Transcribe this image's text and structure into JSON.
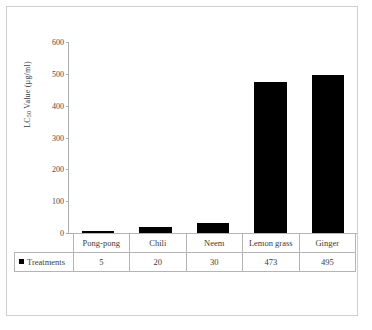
{
  "chart_data": {
    "type": "bar",
    "title": "",
    "xlabel": "",
    "ylabel": "LC50 Value (µg/ml)",
    "ylabel_main": "LC",
    "ylabel_sub": "50",
    "ylabel_rest": " Value (µg/ml)",
    "categories": [
      "Pong-pong",
      "Chili",
      "Neem",
      "Lemon grass",
      "Ginger"
    ],
    "series": [
      {
        "name": "Treatments",
        "values": [
          5,
          20,
          30,
          473,
          495
        ]
      }
    ],
    "values": [
      5,
      20,
      30,
      473,
      495
    ],
    "ylim": [
      0,
      600
    ],
    "yticks": [
      0,
      100,
      200,
      300,
      400,
      500,
      600
    ],
    "ytick_labels": [
      "0",
      "100",
      "200",
      "300",
      "400",
      "500",
      "600"
    ],
    "grid": false,
    "legend_position": "table-left",
    "bar_color": "#000000",
    "axis_color": "#adadad"
  },
  "table": {
    "legend_label": "Treatments",
    "legend_marker": "square-marker",
    "header_row": [
      "Pong-pong",
      "Chili",
      "Neem",
      "Lemon grass",
      "Ginger"
    ],
    "value_row": [
      "5",
      "20",
      "30",
      "473",
      "495"
    ]
  }
}
